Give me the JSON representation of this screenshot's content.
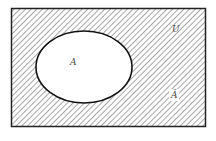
{
  "diagram": {
    "type": "venn-complement",
    "universe_label": "U",
    "set_label": "A",
    "complement_label": "Ā",
    "colors": {
      "stroke": "#222222",
      "hatch": "#777777",
      "background": "#ffffff"
    }
  }
}
